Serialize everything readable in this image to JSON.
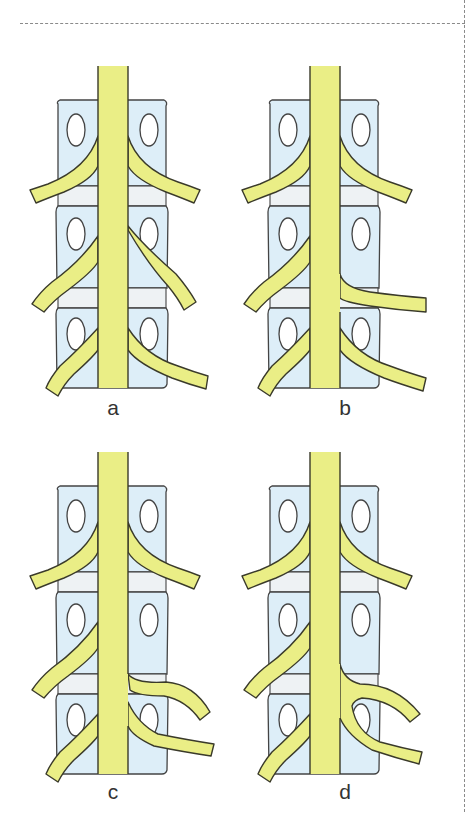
{
  "figure": {
    "colors": {
      "nerve_fill": "#eaee86",
      "nerve_outline": "#3a3a2a",
      "vertebra_fill": "#ddeef8",
      "disc_fill": "#eef2f4",
      "vertebra_outline": "#444444",
      "frame_dash": "#8a8a8a",
      "label_text": "#333333"
    },
    "panels": [
      {
        "id": "a",
        "label": "a",
        "variant": "normal-symmetric-roots"
      },
      {
        "id": "b",
        "label": "b",
        "variant": "extra-root-from-cord-between-levels"
      },
      {
        "id": "c",
        "label": "c",
        "variant": "conjoined-roots-split-origin"
      },
      {
        "id": "d",
        "label": "d",
        "variant": "conjoined-roots-common-trunk"
      }
    ]
  }
}
